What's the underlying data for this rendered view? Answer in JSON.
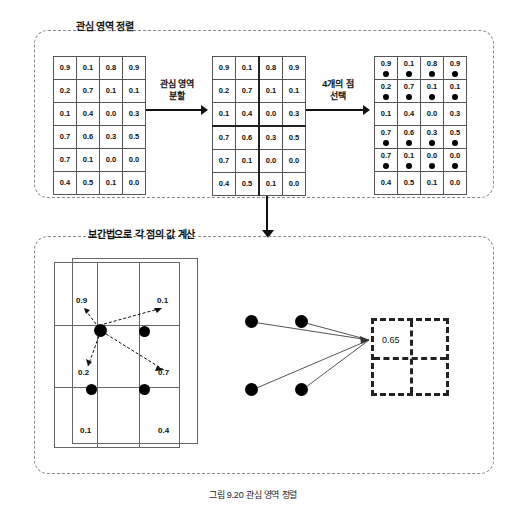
{
  "figure": {
    "caption": "그림 9.20 관심 영역 정렬"
  },
  "top_panel": {
    "title": "관심 영역 정렬",
    "grid_original": {
      "name": "roi-feature-map",
      "rows": 6,
      "cols": 4,
      "values": [
        [
          "0.9",
          "0.1",
          "0.8",
          "0.9"
        ],
        [
          "0.2",
          "0.7",
          "0.1",
          "0.1"
        ],
        [
          "0.1",
          "0.4",
          "0.0",
          "0.3"
        ],
        [
          "0.7",
          "0.6",
          "0.3",
          "0.5"
        ],
        [
          "0.7",
          "0.1",
          "0.0",
          "0.0"
        ],
        [
          "0.4",
          "0.5",
          "0.1",
          "0.0"
        ]
      ]
    },
    "arrow_1": {
      "label_line1": "관심 영역",
      "label_line2": "분할"
    },
    "grid_split": {
      "name": "roi-split-into-bins",
      "rows": 6,
      "cols": 4,
      "values": [
        [
          "0.9",
          "0.1",
          "0.8",
          "0.9"
        ],
        [
          "0.2",
          "0.7",
          "0.1",
          "0.1"
        ],
        [
          "0.1",
          "0.4",
          "0.0",
          "0.3"
        ],
        [
          "0.7",
          "0.6",
          "0.3",
          "0.5"
        ],
        [
          "0.7",
          "0.1",
          "0.0",
          "0.0"
        ],
        [
          "0.4",
          "0.5",
          "0.1",
          "0.0"
        ]
      ],
      "split_col_after": 2,
      "split_row_after": 3
    },
    "arrow_2": {
      "label_line1": "4개의 점",
      "label_line2": "선택"
    },
    "grid_sampled": {
      "name": "roi-sample-points",
      "rows": 6,
      "cols": 4,
      "values": [
        [
          "0.9",
          "0.1",
          "0.8",
          "0.9"
        ],
        [
          "0.2",
          "0.7",
          "0.1",
          "0.1"
        ],
        [
          "0.1",
          "0.4",
          "0.0",
          "0.3"
        ],
        [
          "0.7",
          "0.6",
          "0.3",
          "0.5"
        ],
        [
          "0.7",
          "0.1",
          "0.0",
          "0.0"
        ],
        [
          "0.4",
          "0.5",
          "0.1",
          "0.0"
        ]
      ],
      "dot_rows": [
        0,
        1,
        3,
        4
      ]
    }
  },
  "bottom_panel": {
    "title": "보간법으로 각 점의 값 계산",
    "interpolation": {
      "name": "bilinear-interpolation-cells",
      "labels": [
        {
          "text": "0.9",
          "position": "top-left"
        },
        {
          "text": "0.1",
          "position": "top-right"
        },
        {
          "text": "0.2",
          "position": "mid-left"
        },
        {
          "text": "0.7",
          "position": "mid-right"
        },
        {
          "text": "0.1",
          "position": "bottom-left"
        },
        {
          "text": "0.4",
          "position": "bottom-right"
        }
      ]
    },
    "pooling_result": {
      "name": "max-pool-output",
      "value": "0.65"
    }
  },
  "colors": {
    "panel_border": "#8a8a8a",
    "grid_line": "#555555",
    "dot": "#000000",
    "text": "#111111"
  }
}
